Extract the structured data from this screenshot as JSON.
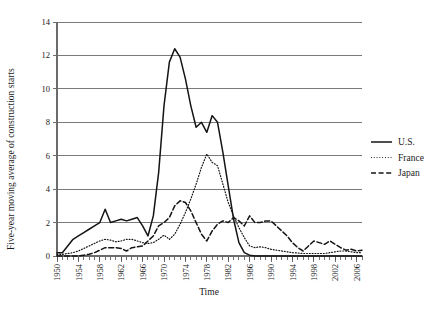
{
  "chart_data": {
    "type": "line",
    "title": "",
    "xlabel": "Time",
    "ylabel": "Five-year moving average of construction starts",
    "xlim": [
      1950,
      2007
    ],
    "ylim": [
      0,
      14
    ],
    "y_ticks": [
      0,
      2,
      4,
      6,
      8,
      10,
      12,
      14
    ],
    "x_ticks": [
      1950,
      1954,
      1958,
      1962,
      1966,
      1970,
      1974,
      1978,
      1982,
      1986,
      1990,
      1994,
      1998,
      2002,
      2006
    ],
    "x_minor_tick_interval": 1,
    "grid": "horizontal",
    "legend_position": "right",
    "x": [
      1950,
      1951,
      1952,
      1953,
      1954,
      1955,
      1956,
      1957,
      1958,
      1959,
      1960,
      1961,
      1962,
      1963,
      1964,
      1965,
      1966,
      1967,
      1968,
      1969,
      1970,
      1971,
      1972,
      1973,
      1974,
      1975,
      1976,
      1977,
      1978,
      1979,
      1980,
      1981,
      1982,
      1983,
      1984,
      1985,
      1986,
      1987,
      1988,
      1989,
      1990,
      1991,
      1992,
      1993,
      1994,
      1995,
      1996,
      1997,
      1998,
      1999,
      2000,
      2001,
      2002,
      2003,
      2004,
      2005,
      2006,
      2007
    ],
    "series": [
      {
        "name": "U.S.",
        "style": "solid",
        "color": "#141414",
        "values": [
          0.2,
          0.2,
          0.6,
          1.0,
          1.2,
          1.4,
          1.6,
          1.8,
          2.0,
          2.8,
          2.0,
          2.1,
          2.2,
          2.1,
          2.2,
          2.3,
          1.8,
          1.2,
          2.4,
          5.0,
          9.0,
          11.6,
          12.4,
          11.9,
          10.6,
          9.0,
          7.7,
          8.0,
          7.4,
          8.4,
          8.0,
          6.2,
          4.2,
          2.2,
          0.8,
          0.2,
          0.05,
          0.0,
          0.0,
          0.0,
          0.0,
          0.0,
          0.0,
          0.0,
          0.0,
          0.0,
          0.0,
          0.0,
          0.0,
          0.0,
          0.0,
          0.0,
          0.0,
          0.0,
          0.0,
          0.0,
          0.0,
          0.0
        ]
      },
      {
        "name": "France",
        "style": "dotted",
        "color": "#4a4a4a",
        "values": [
          0.1,
          0.1,
          0.15,
          0.2,
          0.3,
          0.45,
          0.6,
          0.75,
          0.9,
          1.0,
          0.95,
          0.85,
          0.9,
          1.0,
          1.0,
          0.9,
          0.8,
          0.75,
          0.8,
          1.0,
          1.25,
          1.0,
          1.3,
          1.9,
          2.6,
          3.4,
          4.3,
          5.3,
          6.1,
          5.6,
          5.4,
          4.3,
          3.2,
          2.4,
          1.7,
          1.1,
          0.6,
          0.5,
          0.55,
          0.5,
          0.4,
          0.35,
          0.3,
          0.25,
          0.2,
          0.18,
          0.15,
          0.15,
          0.15,
          0.15,
          0.15,
          0.2,
          0.25,
          0.3,
          0.3,
          0.25,
          0.2,
          0.2
        ]
      },
      {
        "name": "Japan",
        "style": "dashed",
        "color": "#141414",
        "values": [
          0.0,
          0.0,
          0.0,
          0.0,
          0.0,
          0.05,
          0.1,
          0.2,
          0.35,
          0.5,
          0.5,
          0.5,
          0.45,
          0.3,
          0.5,
          0.55,
          0.6,
          0.9,
          1.2,
          1.8,
          2.0,
          2.3,
          3.0,
          3.3,
          3.2,
          2.7,
          2.0,
          1.3,
          0.9,
          1.5,
          1.9,
          2.1,
          2.0,
          2.3,
          2.1,
          1.8,
          2.4,
          2.0,
          2.0,
          2.1,
          2.1,
          1.8,
          1.5,
          1.2,
          0.8,
          0.5,
          0.3,
          0.6,
          0.9,
          0.8,
          0.7,
          0.9,
          0.7,
          0.5,
          0.35,
          0.4,
          0.3,
          0.35
        ]
      }
    ],
    "legend": [
      {
        "label": "U.S.",
        "style": "solid"
      },
      {
        "label": "France",
        "style": "dotted"
      },
      {
        "label": "Japan",
        "style": "dashed"
      }
    ]
  }
}
